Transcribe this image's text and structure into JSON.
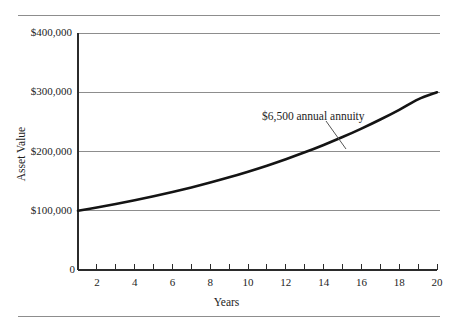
{
  "figure": {
    "background_color": "#ffffff",
    "rule_color": "#8d8d8d",
    "curve_color": "#141414",
    "grid_color": "#8d8d8d"
  },
  "chart_data": {
    "type": "line",
    "title": "",
    "xlabel": "Years",
    "ylabel": "Asset Value",
    "xlim": [
      1,
      20
    ],
    "ylim": [
      0,
      400000
    ],
    "grid": true,
    "legend": "none",
    "annotations": [
      {
        "text": "$6,500 annual annuity",
        "points_to_x": 15,
        "points_to_y": 200000
      }
    ],
    "y_tick_labels": [
      "$400,000",
      "$300,000",
      "$200,000",
      "$100,000",
      "0"
    ],
    "y_tick_values": [
      400000,
      300000,
      200000,
      100000,
      0
    ],
    "x_tick_labels": [
      "2",
      "4",
      "6",
      "8",
      "10",
      "12",
      "14",
      "16",
      "18",
      "20"
    ],
    "x_tick_values": [
      2,
      4,
      6,
      8,
      10,
      12,
      14,
      16,
      18,
      20
    ],
    "x_minor_ticks": [
      1,
      2,
      3,
      4,
      5,
      6,
      7,
      8,
      9,
      10,
      11,
      12,
      13,
      14,
      15,
      16,
      17,
      18,
      19,
      20
    ],
    "series": [
      {
        "name": "$6,500 annual annuity",
        "x": [
          1,
          2,
          3,
          4,
          5,
          6,
          7,
          8,
          9,
          10,
          11,
          12,
          13,
          14,
          15,
          16,
          17,
          18,
          19,
          20
        ],
        "values": [
          100000,
          105500,
          111400,
          117700,
          124500,
          131700,
          139400,
          147700,
          156500,
          166000,
          176100,
          187000,
          198600,
          211100,
          224400,
          238700,
          254000,
          270400,
          288000,
          300000
        ]
      }
    ]
  }
}
